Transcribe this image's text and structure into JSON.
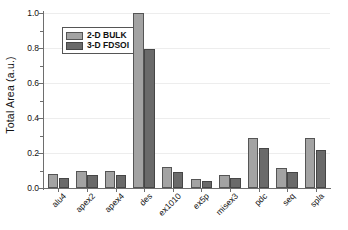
{
  "chart_data": {
    "type": "bar",
    "title": "",
    "xlabel": "",
    "ylabel": "Total Area (a.u.)",
    "ylim": [
      0.0,
      1.0
    ],
    "yticks": [
      0.0,
      0.2,
      0.4,
      0.6,
      0.8,
      1.0
    ],
    "ytick_labels": [
      "0.0",
      "0.2",
      "0.4",
      "0.6",
      "0.8",
      "1.0"
    ],
    "grid": true,
    "legend_position": "upper-left-inside",
    "categories": [
      "alu4",
      "apex2",
      "apex4",
      "des",
      "ex1010",
      "ex5p",
      "misex3",
      "pdc",
      "seq",
      "spla"
    ],
    "series": [
      {
        "name": "2-D BULK",
        "color": "#a3a3a3",
        "values": [
          0.08,
          0.1,
          0.1,
          1.0,
          0.12,
          0.052,
          0.077,
          0.285,
          0.115,
          0.285
        ]
      },
      {
        "name": "3-D FDSOI",
        "color": "#6a6a6a",
        "values": [
          0.06,
          0.077,
          0.076,
          0.795,
          0.09,
          0.04,
          0.057,
          0.228,
          0.09,
          0.22
        ]
      }
    ]
  },
  "legend": {
    "entries": [
      {
        "label": "2-D BULK"
      },
      {
        "label": "3-D FDSOI"
      }
    ]
  },
  "axes": {
    "y_title": "Total Area (a.u.)"
  }
}
